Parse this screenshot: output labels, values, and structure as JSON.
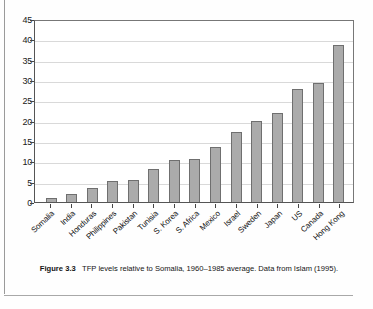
{
  "chart_data": {
    "type": "bar",
    "title": "",
    "xlabel": "",
    "ylabel": "",
    "ylim": [
      0,
      45
    ],
    "ytick_step": 5,
    "yticks": [
      45,
      40,
      35,
      30,
      25,
      20,
      15,
      10,
      5,
      0
    ],
    "grid": true,
    "legend": "none",
    "categories": [
      "Somalia",
      "India",
      "Honduras",
      "Philippines",
      "Pakistan",
      "Tunisia",
      "S. Korea",
      "S. Africa",
      "Mexico",
      "Israel",
      "Sweden",
      "Japan",
      "US",
      "Canada",
      "Hong Kong"
    ],
    "values": [
      1.0,
      2.0,
      3.5,
      5.1,
      5.5,
      8.0,
      10.3,
      10.7,
      13.5,
      17.2,
      19.8,
      21.9,
      27.8,
      29.2,
      38.7
    ],
    "bar_color": "#ababab",
    "bar_edge_color": "#6f6f6f",
    "grid_color": "#d9d9d9",
    "axis_color": "#555555"
  },
  "caption": {
    "figure_number": "Figure 3.3",
    "text": "TFP levels relative to Somalia, 1960–1985 average. Data from Islam (1995)."
  }
}
